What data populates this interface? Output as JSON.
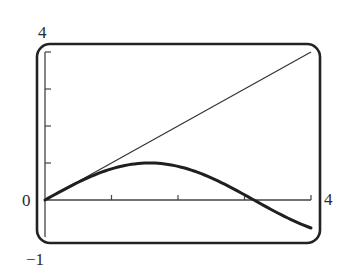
{
  "chart_data": {
    "type": "line",
    "title": "",
    "xlabel": "",
    "ylabel": "",
    "xlim": [
      0,
      4
    ],
    "ylim": [
      -1,
      4
    ],
    "grid": false,
    "legend": null,
    "x_tick_labels": [
      "0",
      "4"
    ],
    "y_tick_labels": [
      "4",
      "0",
      "-1"
    ],
    "x_ticks": [
      1,
      2,
      3,
      4
    ],
    "y_ticks": [
      1,
      2,
      3,
      4
    ],
    "series": [
      {
        "name": "y = x",
        "style": "thin",
        "x": [
          0,
          4
        ],
        "values": [
          0,
          4
        ]
      },
      {
        "name": "y = sin x",
        "style": "thick",
        "x": [
          0,
          0.5,
          1,
          1.5,
          1.5708,
          2,
          2.5,
          3,
          3.1416,
          3.5,
          4
        ],
        "values": [
          0,
          0.479,
          0.841,
          0.997,
          1.0,
          0.909,
          0.598,
          0.141,
          0,
          -0.351,
          -0.757
        ]
      }
    ]
  },
  "labels": {
    "y_top": "4",
    "y_origin": "0",
    "y_bottom": "−1",
    "x_right": "4"
  },
  "colors": {
    "frame": "#222222",
    "axis": "#444444",
    "line": "#333333",
    "curve": "#1f1f1f"
  }
}
